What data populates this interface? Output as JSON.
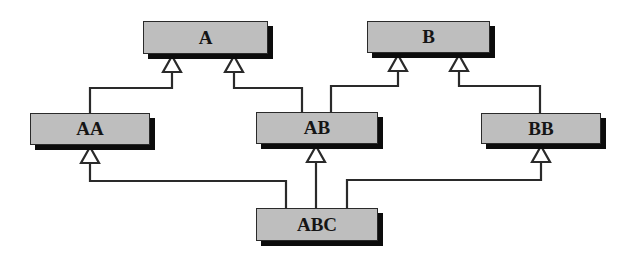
{
  "diagram": {
    "type": "class-inheritance-diagram",
    "colors": {
      "node_fill": "#bebebe",
      "node_border": "#2a2a2a",
      "shadow": "#0c0c0c",
      "line": "#2a2a2a",
      "arrow_fill": "#ffffff"
    },
    "nodes": [
      {
        "id": "A",
        "label": "A",
        "x": 143,
        "y": 21,
        "w": 125,
        "h": 33
      },
      {
        "id": "B",
        "label": "B",
        "x": 367,
        "y": 21,
        "w": 123,
        "h": 32
      },
      {
        "id": "AA",
        "label": "AA",
        "x": 30,
        "y": 113,
        "w": 120,
        "h": 32
      },
      {
        "id": "AB",
        "label": "AB",
        "x": 256,
        "y": 112,
        "w": 122,
        "h": 32
      },
      {
        "id": "BB",
        "label": "BB",
        "x": 481,
        "y": 113,
        "w": 120,
        "h": 31
      },
      {
        "id": "ABC",
        "label": "ABC",
        "x": 256,
        "y": 208,
        "w": 122,
        "h": 33
      }
    ],
    "edges": [
      {
        "from": "AA",
        "to": "A",
        "relation": "inherits",
        "points": [
          [
            90,
            113
          ],
          [
            90,
            88
          ],
          [
            172,
            88
          ],
          [
            172,
            72
          ]
        ],
        "arrow_tip": [
          172,
          56
        ]
      },
      {
        "from": "AB",
        "to": "A",
        "relation": "inherits",
        "points": [
          [
            302,
            112
          ],
          [
            302,
            88
          ],
          [
            234,
            88
          ],
          [
            234,
            72
          ]
        ],
        "arrow_tip": [
          234,
          56
        ]
      },
      {
        "from": "AB",
        "to": "B",
        "relation": "inherits",
        "points": [
          [
            331,
            112
          ],
          [
            331,
            86
          ],
          [
            398,
            86
          ],
          [
            398,
            71
          ]
        ],
        "arrow_tip": [
          398,
          55
        ]
      },
      {
        "from": "BB",
        "to": "B",
        "relation": "inherits",
        "points": [
          [
            540,
            113
          ],
          [
            540,
            86
          ],
          [
            459,
            86
          ],
          [
            459,
            71
          ]
        ],
        "arrow_tip": [
          459,
          55
        ]
      },
      {
        "from": "ABC",
        "to": "AA",
        "relation": "inherits",
        "points": [
          [
            286,
            208
          ],
          [
            286,
            181
          ],
          [
            90,
            181
          ],
          [
            90,
            163
          ]
        ],
        "arrow_tip": [
          90,
          147
        ]
      },
      {
        "from": "ABC",
        "to": "AB",
        "relation": "inherits",
        "points": [
          [
            316,
            208
          ],
          [
            316,
            162
          ]
        ],
        "arrow_tip": [
          316,
          146
        ]
      },
      {
        "from": "ABC",
        "to": "BB",
        "relation": "inherits",
        "points": [
          [
            347,
            208
          ],
          [
            347,
            180
          ],
          [
            541,
            180
          ],
          [
            541,
            162
          ]
        ],
        "arrow_tip": [
          541,
          146
        ]
      }
    ]
  }
}
